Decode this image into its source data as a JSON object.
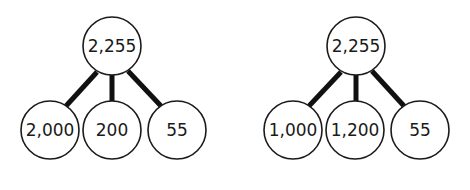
{
  "diagrams": [
    {
      "root": {
        "label": "2,255",
        "cx": 112,
        "cy": 46,
        "r": 29
      },
      "children": [
        {
          "label": "2,000",
          "cx": 50,
          "cy": 130,
          "r": 29
        },
        {
          "label": "200",
          "cx": 112,
          "cy": 130,
          "r": 29
        },
        {
          "label": "55",
          "cx": 177,
          "cy": 130,
          "r": 29
        }
      ]
    },
    {
      "root": {
        "label": "2,255",
        "cx": 356,
        "cy": 46,
        "r": 29
      },
      "children": [
        {
          "label": "1,000",
          "cx": 293,
          "cy": 130,
          "r": 29
        },
        {
          "label": "1,200",
          "cx": 355,
          "cy": 130,
          "r": 29
        },
        {
          "label": "55",
          "cx": 420,
          "cy": 130,
          "r": 29
        }
      ]
    }
  ],
  "colors": {
    "stroke": "#1a1a1a",
    "fill": "#ffffff",
    "edge": "#111111"
  }
}
